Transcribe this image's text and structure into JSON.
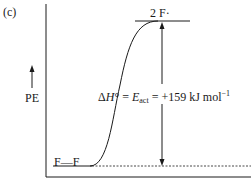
{
  "panel_label": "(c)",
  "axes": {
    "y_label": "PE",
    "x_label": ""
  },
  "levels": {
    "reactant": "F—F",
    "product": "2 F·"
  },
  "annotation": {
    "delta": "Δ",
    "H": "H",
    "degree_eq": "° = ",
    "E": "E",
    "act": "act",
    "rest": " = +159 kJ mol",
    "exp": "−1"
  },
  "colors": {
    "ink": "#1a1a1a",
    "background": "#ffffff"
  }
}
